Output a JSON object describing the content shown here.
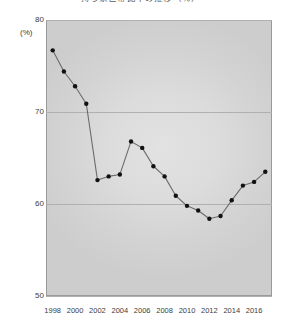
{
  "chart_data": {
    "type": "line",
    "title": "持ち家世帯比率の推移（％）",
    "xlabel": "",
    "ylabel": "(%)",
    "ylim": [
      50,
      80
    ],
    "yticks": [
      80,
      70,
      60,
      50
    ],
    "xlim": [
      1997.4,
      2017.6
    ],
    "xticks": [
      1998,
      2000,
      2002,
      2004,
      2006,
      2008,
      2010,
      2012,
      2014,
      2016
    ],
    "grid": true,
    "legend": "none",
    "marker": "circle",
    "line_color": "#6b6b6b",
    "marker_color": "#111111",
    "panel_color": "#d9d9d9",
    "x": [
      1998,
      1999,
      2000,
      2001,
      2002,
      2003,
      2004,
      2005,
      2006,
      2007,
      2008,
      2009,
      2010,
      2011,
      2012,
      2013,
      2014,
      2015,
      2016,
      2017
    ],
    "values": [
      76.7,
      74.4,
      72.8,
      70.9,
      62.6,
      63.0,
      63.2,
      66.8,
      66.1,
      64.1,
      63.0,
      60.9,
      59.8,
      59.3,
      58.4,
      58.7,
      60.4,
      62.0,
      62.4,
      63.5
    ]
  },
  "axis": {
    "y_unit": "(%)",
    "y_tick_labels": [
      "80",
      "70",
      "60",
      "50"
    ],
    "x_tick_labels": [
      "1998",
      "2000",
      "2002",
      "2004",
      "2006",
      "2008",
      "2010",
      "2012",
      "2014",
      "2016"
    ]
  }
}
